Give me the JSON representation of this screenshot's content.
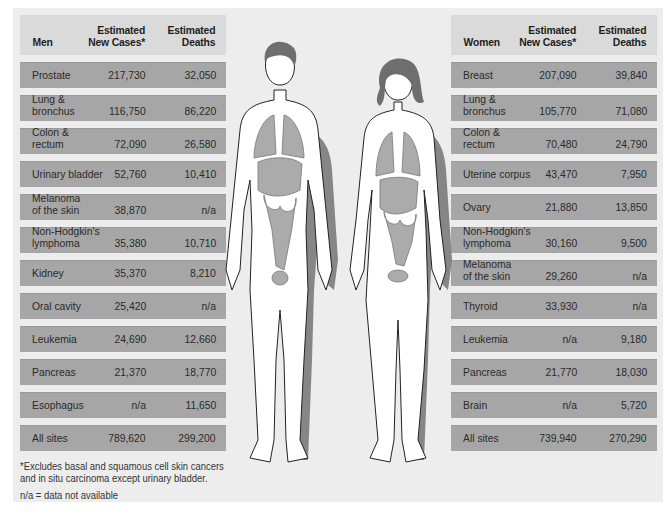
{
  "men": {
    "header": {
      "label": "Men",
      "col_new": "Estimated\nNew Cases*",
      "col_deaths": "Estimated\nDeaths"
    },
    "rows": [
      {
        "site": "Prostate",
        "new": "217,730",
        "deaths": "32,050"
      },
      {
        "site": "Lung &\nbronchus",
        "new": "116,750",
        "deaths": "86,220"
      },
      {
        "site": "Colon &\nrectum",
        "new": "72,090",
        "deaths": "26,580"
      },
      {
        "site": "Urinary bladder",
        "new": "52,760",
        "deaths": "10,410"
      },
      {
        "site": "Melanoma\nof the skin",
        "new": "38,870",
        "deaths": "n/a"
      },
      {
        "site": "Non-Hodgkin's\nlymphoma",
        "new": "35,380",
        "deaths": "10,710"
      },
      {
        "site": "Kidney",
        "new": "35,370",
        "deaths": "8,210"
      },
      {
        "site": "Oral cavity",
        "new": "25,420",
        "deaths": "n/a"
      },
      {
        "site": "Leukemia",
        "new": "24,690",
        "deaths": "12,660"
      },
      {
        "site": "Pancreas",
        "new": "21,370",
        "deaths": "18,770"
      },
      {
        "site": "Esophagus",
        "new": "n/a",
        "deaths": "11,650"
      },
      {
        "site": "All sites",
        "new": "789,620",
        "deaths": "299,200"
      }
    ]
  },
  "women": {
    "header": {
      "label": "Women",
      "col_new": "Estimated\nNew Cases*",
      "col_deaths": "Estimated\nDeaths"
    },
    "rows": [
      {
        "site": "Breast",
        "new": "207,090",
        "deaths": "39,840"
      },
      {
        "site": "Lung &\nbronchus",
        "new": "105,770",
        "deaths": "71,080"
      },
      {
        "site": "Colon &\nrectum",
        "new": "70,480",
        "deaths": "24,790"
      },
      {
        "site": "Uterine corpus",
        "new": "43,470",
        "deaths": "7,950"
      },
      {
        "site": "Ovary",
        "new": "21,880",
        "deaths": "13,850"
      },
      {
        "site": "Non-Hodgkin's\nlymphoma",
        "new": "30,160",
        "deaths": "9,500"
      },
      {
        "site": "Melanoma\nof the skin",
        "new": "29,260",
        "deaths": "n/a"
      },
      {
        "site": "Thyroid",
        "new": "33,930",
        "deaths": "n/a"
      },
      {
        "site": "Leukemia",
        "new": "n/a",
        "deaths": "9,180"
      },
      {
        "site": "Pancreas",
        "new": "21,770",
        "deaths": "18,030"
      },
      {
        "site": "Brain",
        "new": "n/a",
        "deaths": "5,720"
      },
      {
        "site": "All sites",
        "new": "739,940",
        "deaths": "270,290"
      }
    ]
  },
  "footnote": {
    "asterisk": "*Excludes basal and squamous cell skin cancers\nand in situ carcinoma except urinary bladder.",
    "na": "n/a = data not available"
  },
  "colors": {
    "background": "#ededed",
    "header": "#dadada",
    "row": "#a6a6a6",
    "organ": "#a9a9a9"
  }
}
